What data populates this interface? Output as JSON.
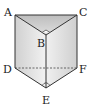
{
  "diagram": {
    "type": "triangular-prism",
    "vertices": {
      "A": {
        "label": "A",
        "x": 15,
        "y": 15
      },
      "B": {
        "label": "B",
        "x": 46,
        "y": 35
      },
      "C": {
        "label": "C",
        "x": 77,
        "y": 15
      },
      "D": {
        "label": "D",
        "x": 15,
        "y": 68
      },
      "E": {
        "label": "E",
        "x": 46,
        "y": 88
      },
      "F": {
        "label": "F",
        "x": 77,
        "y": 68
      }
    },
    "labels": {
      "A": "A",
      "B": "B",
      "C": "C",
      "D": "D",
      "E": "E",
      "F": "F"
    },
    "right_angles": [
      "B",
      "E"
    ],
    "hidden_edges": [
      "DF"
    ],
    "colors": {
      "top_face": "#c8c8c8",
      "left_face": "#e4e4e4",
      "right_face": "#d6d6d6",
      "edge": "#333333"
    }
  }
}
